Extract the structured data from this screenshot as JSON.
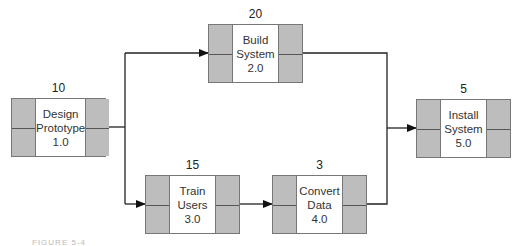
{
  "nodes": [
    {
      "id": "design",
      "duration": "10",
      "line1": "Design",
      "line2": "Prototype",
      "code": "1.0"
    },
    {
      "id": "build",
      "duration": "20",
      "line1": "Build",
      "line2": "System",
      "code": "2.0"
    },
    {
      "id": "train",
      "duration": "15",
      "line1": "Train",
      "line2": "Users",
      "code": "3.0"
    },
    {
      "id": "convert",
      "duration": "3",
      "line1": "Convert",
      "line2": "Data",
      "code": "4.0"
    },
    {
      "id": "install",
      "duration": "5",
      "line1": "Install",
      "line2": "System",
      "code": "5.0"
    }
  ],
  "edges": [
    {
      "from": "1.0",
      "to": "2.0"
    },
    {
      "from": "1.0",
      "to": "3.0"
    },
    {
      "from": "3.0",
      "to": "4.0"
    },
    {
      "from": "2.0",
      "to": "5.0"
    },
    {
      "from": "4.0",
      "to": "5.0"
    }
  ],
  "caption": "FIGURE 5-4"
}
